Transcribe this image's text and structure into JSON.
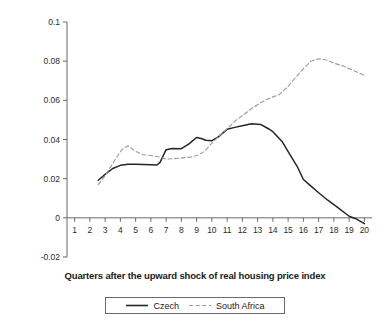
{
  "chart_data": {
    "type": "line",
    "title": "",
    "xlabel": "Quarters after the upward shock of real housing price index",
    "ylabel": "Logged real investment",
    "xlim": [
      0.5,
      20.5
    ],
    "ylim": [
      -0.02,
      0.1
    ],
    "grid": false,
    "legend_position": "bottom-center",
    "x_ticks": [
      "1",
      "2",
      "3",
      "4",
      "5",
      "6",
      "7",
      "8",
      "9",
      "10",
      "11",
      "12",
      "13",
      "14",
      "15",
      "16",
      "17",
      "18",
      "19",
      "20"
    ],
    "y_ticks": [
      "0.1",
      "0.08",
      "0.06",
      "0.04",
      "0.02",
      "0",
      "-0.02"
    ],
    "y_tick_values": [
      0.1,
      0.08,
      0.06,
      0.04,
      0.02,
      0,
      -0.02
    ],
    "series": [
      {
        "name": "Czech",
        "style": "solid",
        "color": "#262626",
        "x": [
          2.55,
          3.0,
          3.5,
          4.0,
          4.5,
          5.0,
          5.5,
          6.0,
          6.4,
          6.6,
          7.0,
          7.4,
          8.0,
          8.5,
          9.0,
          9.3,
          9.6,
          10.0,
          10.4,
          11.0,
          11.5,
          12.0,
          12.6,
          13.2,
          13.7,
          14.0,
          14.6,
          15.0,
          15.6,
          16.0,
          16.5,
          17.0,
          17.6,
          18.2,
          19.0,
          19.4,
          20.0
        ],
        "y": [
          0.0192,
          0.0222,
          0.0252,
          0.0268,
          0.0274,
          0.0273,
          0.0272,
          0.0271,
          0.027,
          0.0283,
          0.0348,
          0.0354,
          0.0353,
          0.0378,
          0.041,
          0.0405,
          0.0396,
          0.0394,
          0.0412,
          0.0452,
          0.0462,
          0.047,
          0.048,
          0.0477,
          0.0455,
          0.044,
          0.039,
          0.0338,
          0.0262,
          0.0196,
          0.0162,
          0.0128,
          0.009,
          0.0056,
          0.0008,
          -0.0003,
          -0.003
        ]
      },
      {
        "name": "South Africa",
        "style": "dashed",
        "color": "#9a9a9a",
        "x": [
          2.55,
          3.0,
          3.6,
          4.1,
          4.5,
          5.0,
          5.5,
          6.0,
          6.5,
          7.0,
          7.5,
          8.0,
          8.6,
          9.0,
          9.5,
          10.0,
          10.5,
          11.0,
          11.6,
          12.0,
          12.6,
          13.2,
          13.8,
          14.4,
          15.0,
          15.5,
          16.0,
          16.5,
          17.0,
          17.5,
          18.0,
          18.6,
          19.2,
          20.0
        ],
        "y": [
          0.017,
          0.0215,
          0.029,
          0.0348,
          0.0368,
          0.034,
          0.0322,
          0.0318,
          0.0312,
          0.03,
          0.0302,
          0.0306,
          0.031,
          0.0318,
          0.0338,
          0.0382,
          0.042,
          0.0455,
          0.05,
          0.0522,
          0.0558,
          0.0588,
          0.0612,
          0.0628,
          0.0672,
          0.0718,
          0.0762,
          0.08,
          0.0812,
          0.0806,
          0.079,
          0.0775,
          0.0755,
          0.0728
        ]
      }
    ],
    "legend": [
      {
        "label": "Czech",
        "style": "solid",
        "color": "#262626"
      },
      {
        "label": "South Africa",
        "style": "dashed",
        "color": "#9a9a9a"
      }
    ]
  },
  "axis": {
    "color": "#6a6a6a"
  }
}
